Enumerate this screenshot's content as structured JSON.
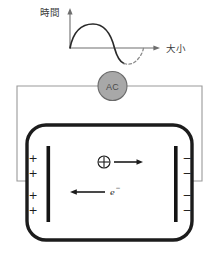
{
  "diagram": {
    "title_label": "時間",
    "axis": {
      "vertical_label": "時間",
      "horizontal_label": "大小"
    },
    "source": {
      "label": "AC",
      "type": "alternating-current-source"
    },
    "chamber": {
      "left_electrode": {
        "polarity": "+",
        "signs": [
          "+",
          "+",
          "+",
          "+"
        ]
      },
      "right_electrode": {
        "polarity": "−",
        "signs": [
          "−",
          "−",
          "−",
          "−"
        ]
      },
      "particles": [
        {
          "symbol": "⊕",
          "name": "positive-ion",
          "direction": "right"
        },
        {
          "symbol": "e",
          "superscript": "−",
          "name": "electron",
          "direction": "left"
        }
      ]
    },
    "waveform": {
      "type": "sine",
      "solid_phase": "first-half-cycle",
      "dashed_phase": "second-half-cycle"
    },
    "colors": {
      "source_fill": "#a8a8a8",
      "wire": "#9a9a9a",
      "chamber_wall": "#1c1c1c",
      "electrode": "#141414",
      "axis": "#6e6e6e"
    }
  }
}
